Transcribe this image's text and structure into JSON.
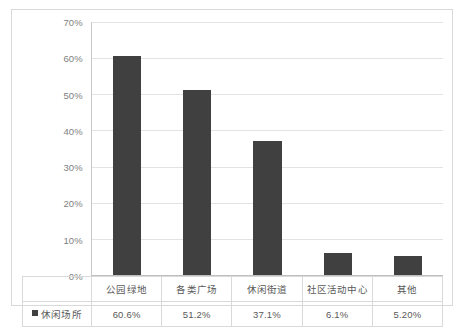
{
  "chart_data": {
    "type": "bar",
    "title": "",
    "subtitle": "",
    "xlabel": "",
    "ylabel": "",
    "ylim": [
      0,
      70
    ],
    "grid": true,
    "legend_position": "bottom-table",
    "y_ticks": [
      "70%",
      "60%",
      "50%",
      "40%",
      "30%",
      "20%",
      "10%",
      "0%"
    ],
    "y_tick_values": [
      70,
      60,
      50,
      40,
      30,
      20,
      10,
      0
    ],
    "categories": [
      "公园绿地",
      "各类广场",
      "休闲街道",
      "社区活动中心",
      "其他"
    ],
    "values": [
      60.6,
      51.2,
      37.1,
      6.1,
      5.2
    ],
    "value_labels": [
      "60.6%",
      "51.2%",
      "37.1%",
      "6.1%",
      "5.20%"
    ],
    "series": [
      {
        "name": "休闲场所",
        "values": [
          60.6,
          51.2,
          37.1,
          6.1,
          5.2
        ],
        "color": "#404040"
      }
    ]
  },
  "legend": {
    "marker": "square-marker",
    "label": "休闲场所"
  },
  "colors": {
    "bar": "#404040",
    "gridline": "#e3e3e3",
    "axis": "#bfbfbf",
    "frame_border": "#d9d9d9",
    "tick_text": "#7f7f7f",
    "table_text": "#595959"
  }
}
